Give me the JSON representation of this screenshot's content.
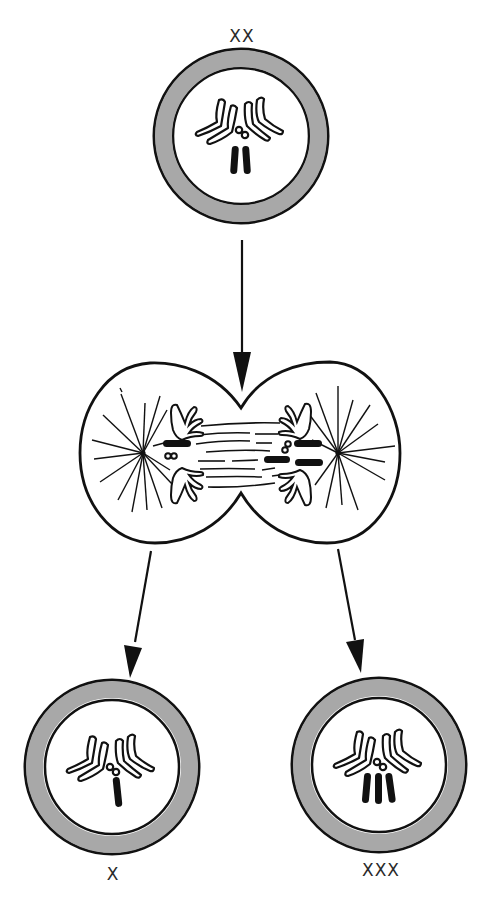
{
  "diagram": {
    "type": "cell-division-nondisjunction",
    "colors": {
      "background": "#ffffff",
      "ink": "#111111",
      "cell_wall_gray": "#a8a8a8",
      "label": "#2a2a2a"
    },
    "parent_cell": {
      "label": "XX",
      "x_chromosome_count": 2
    },
    "dividing_cell": {
      "stage": "anaphase",
      "note": "sister X chromatids both migrate to the right pole"
    },
    "daughter_cells": [
      {
        "label": "X",
        "x_chromosome_count": 1
      },
      {
        "label": "XXX",
        "x_chromosome_count": 3
      }
    ],
    "arrows": [
      {
        "from": "parent_cell",
        "to": "dividing_cell"
      },
      {
        "from": "dividing_cell",
        "to": "daughter_cell_left"
      },
      {
        "from": "dividing_cell",
        "to": "daughter_cell_right"
      }
    ]
  }
}
